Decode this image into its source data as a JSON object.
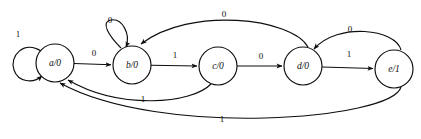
{
  "diagram": {
    "type": "finite-state-machine",
    "title": "",
    "background_color": "#ffffff",
    "stroke_color": "#0d0d0d",
    "states": [
      {
        "id": "a",
        "label": "a/0",
        "output": "0",
        "cx": 55,
        "cy": 63,
        "r": 19
      },
      {
        "id": "b",
        "label": "b/0",
        "output": "0",
        "cx": 132,
        "cy": 65,
        "r": 19
      },
      {
        "id": "c",
        "label": "c/0",
        "output": "0",
        "cx": 218,
        "cy": 66,
        "r": 19
      },
      {
        "id": "d",
        "label": "d/0",
        "output": "0",
        "cx": 303,
        "cy": 66,
        "r": 19
      },
      {
        "id": "e",
        "label": "e/1",
        "output": "1",
        "cx": 394,
        "cy": 69,
        "r": 19
      }
    ],
    "transitions": [
      {
        "id": "a-a",
        "from": "a",
        "to": "a",
        "label": "1",
        "kind": "self-loop",
        "label_x": 18,
        "label_y": 35
      },
      {
        "id": "a-b",
        "from": "a",
        "to": "b",
        "label": "0",
        "kind": "straight",
        "label_x": 94,
        "label_y": 54
      },
      {
        "id": "b-b",
        "from": "b",
        "to": "b",
        "label": "0",
        "kind": "self-loop",
        "label_x": 110,
        "label_y": 21
      },
      {
        "id": "b-c",
        "from": "b",
        "to": "c",
        "label": "1",
        "kind": "straight",
        "label_x": 175,
        "label_y": 56
      },
      {
        "id": "c-d",
        "from": "c",
        "to": "d",
        "label": "0",
        "kind": "straight",
        "label_x": 261,
        "label_y": 57
      },
      {
        "id": "c-a",
        "from": "c",
        "to": "a",
        "label": "1",
        "kind": "arc-below",
        "label_x": 143,
        "label_y": 100
      },
      {
        "id": "d-b",
        "from": "d",
        "to": "b",
        "label": "0",
        "kind": "arc-above",
        "label_x": 224,
        "label_y": 15
      },
      {
        "id": "d-e",
        "from": "d",
        "to": "e",
        "label": "1",
        "kind": "straight",
        "label_x": 349,
        "label_y": 55
      },
      {
        "id": "e-d",
        "from": "e",
        "to": "d",
        "label": "0",
        "kind": "arc-above",
        "label_x": 350,
        "label_y": 30
      },
      {
        "id": "e-a",
        "from": "e",
        "to": "a",
        "label": "1",
        "kind": "arc-below",
        "label_x": 222,
        "label_y": 120
      }
    ]
  }
}
